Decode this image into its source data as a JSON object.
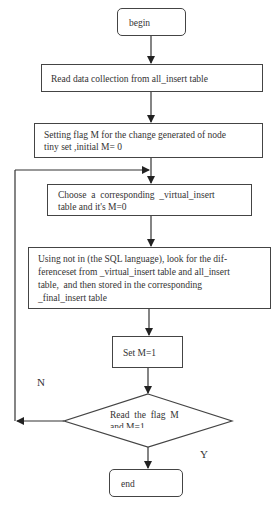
{
  "flowchart": {
    "nodes": [
      {
        "id": "begin",
        "type": "terminal",
        "label": "begin"
      },
      {
        "id": "read",
        "type": "process",
        "label": "Read data collection from all_insert table"
      },
      {
        "id": "setting",
        "type": "process",
        "line1": "Setting flag M for the change generated of node",
        "line2": "tiny set ,initial M= 0"
      },
      {
        "id": "choose",
        "type": "process",
        "line1": "Choose  a  corresponding  _virtual_insert",
        "line2": "table and it's M=0"
      },
      {
        "id": "using",
        "type": "process",
        "line1": "Using not in (the SQL language), look for the dif-",
        "line2": "ferenceset from _virtual_insert table and all_insert",
        "line3": "table,  and then stored in the corresponding",
        "line4": "_final_insert table"
      },
      {
        "id": "setm",
        "type": "process",
        "label": "Set M=1"
      },
      {
        "id": "decision",
        "type": "decision",
        "line1": "Read  the  flag  M",
        "line2": "and M=1"
      },
      {
        "id": "end",
        "type": "terminal",
        "label": "end"
      }
    ],
    "edges": {
      "no_label": "N",
      "yes_label": "Y"
    }
  }
}
